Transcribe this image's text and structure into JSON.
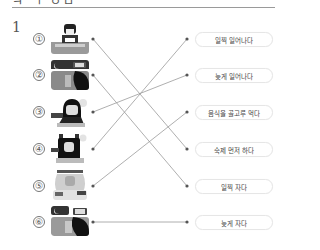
{
  "header": {
    "title_fragment": "ㅋ ㄱ ㅇㅁ",
    "question_number": "1"
  },
  "left_items": [
    {
      "number": "①",
      "picture": "studying-at-desk"
    },
    {
      "number": "②",
      "picture": "night-sleeping-clock"
    },
    {
      "number": "③",
      "picture": "waking-up-alarm"
    },
    {
      "number": "④",
      "picture": "doing-homework"
    },
    {
      "number": "⑤",
      "picture": "eating-food"
    },
    {
      "number": "⑥",
      "picture": "sleeping-late-night"
    }
  ],
  "right_items": [
    {
      "label": "일찍 일어나다"
    },
    {
      "label": "늦게 일어나다"
    },
    {
      "label": "음식을 골고루 먹다"
    },
    {
      "label": "숙제 먼저 하다"
    },
    {
      "label": "일찍 자다"
    },
    {
      "label": "늦게 자다"
    }
  ],
  "connections": [
    {
      "from": 1,
      "to": 4
    },
    {
      "from": 2,
      "to": 5
    },
    {
      "from": 3,
      "to": 2
    },
    {
      "from": 4,
      "to": 1
    },
    {
      "from": 5,
      "to": 3
    },
    {
      "from": 6,
      "to": 6
    }
  ],
  "colors": {
    "line": "#9a9a9a",
    "dot": "#555555",
    "box_border": "#e6e6e6"
  }
}
